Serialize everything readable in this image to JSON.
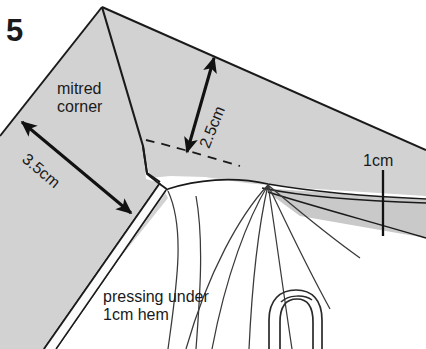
{
  "figure": {
    "step_number": "5",
    "type": "sewing-instruction-diagram",
    "background_color": "#ffffff",
    "fabric_fill_color": "#d2d2d2",
    "line_color": "#1a1a1a"
  },
  "labels": {
    "mitred_corner": "mitred\ncorner",
    "mitred_corner_line1": "mitred",
    "mitred_corner_line2": "corner",
    "pressing_line1": "pressing under",
    "pressing_line2": "1cm hem"
  },
  "dimensions": [
    {
      "id": "diagonal-mitre",
      "value": "3.5cm",
      "arrow": "double-headed",
      "orientation_deg": 40,
      "from": [
        22,
        122
      ],
      "to": [
        131,
        213
      ]
    },
    {
      "id": "mitre-depth",
      "value": "2.5cm",
      "arrow": "double-headed",
      "orientation_deg": -68,
      "from": [
        214,
        58
      ],
      "to": [
        186,
        152
      ]
    },
    {
      "id": "hem-width",
      "value": "1cm",
      "arrow": "tick-line",
      "orientation_deg": 90,
      "from": [
        383,
        170
      ],
      "to": [
        383,
        236
      ]
    }
  ],
  "annotations": {
    "fold_line_style": "dashed",
    "fold_line_label": "mitre fold line",
    "hem_label": "1cm hem",
    "icon_names": [
      "arrow-double-head-icon",
      "dashed-fold-line-icon",
      "fingertip-icon"
    ]
  }
}
